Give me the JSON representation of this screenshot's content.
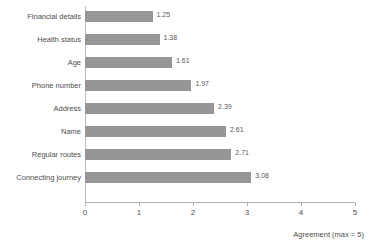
{
  "chart_data": {
    "type": "bar",
    "orientation": "horizontal",
    "title": "",
    "subtitle": "",
    "xlabel": "Agreement (max = 5)",
    "ylabel": "",
    "xlim": [
      0,
      5
    ],
    "xticks": [
      "0",
      "1",
      "2",
      "3",
      "4",
      "5"
    ],
    "grid": false,
    "legend": null,
    "bar_color": "#969696",
    "categories": [
      "Financial details",
      "Health status",
      "Age",
      "Phone number",
      "Address",
      "Name",
      "Regular routes",
      "Connecting journey"
    ],
    "values": [
      1.25,
      1.38,
      1.61,
      1.97,
      2.39,
      2.61,
      2.71,
      3.08
    ],
    "value_labels": [
      "1.25",
      "1.38",
      "1.61",
      "1.97",
      "2.39",
      "2.61",
      "2.71",
      "3.08"
    ]
  }
}
